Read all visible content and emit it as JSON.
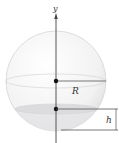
{
  "diagram": {
    "axis_label": "y",
    "radius_label": "R",
    "height_label": "h",
    "colors": {
      "sphere_fill": "#f4f4f5",
      "sphere_edge": "#d8d8da",
      "cap_fill": "#e6e6e8",
      "line": "#444444",
      "dot": "#111111"
    }
  }
}
